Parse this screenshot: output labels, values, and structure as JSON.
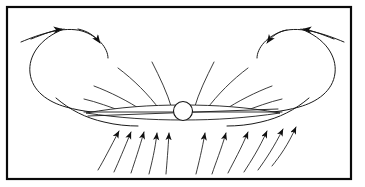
{
  "figure": {
    "background_color": "#ffffff",
    "frame": {
      "name": "outer-border",
      "stroke_color": "#0a0a0a",
      "stroke_width": 2.2,
      "x": 7,
      "y": 7,
      "width": 344,
      "height": 172
    },
    "central_object": {
      "label": "central compact object",
      "shape": "circle",
      "cx": 183,
      "cy": 111,
      "r": 9.5,
      "fill": "#ffffff",
      "stroke": "#141414"
    },
    "disk": {
      "label": "thin accretion disk",
      "shape": "lens",
      "left_x": 86,
      "right_x": 280,
      "center_y": 112,
      "half_thickness": 3.2,
      "stroke": "#1a1a1a"
    },
    "line_color": "#1a1a1a",
    "arrow_color": "#101010",
    "counts": {
      "upper_field_lines": 8,
      "lower_inflow_arrows": 11,
      "loop_arcs": 2,
      "loop_arrowheads": 4
    },
    "annotations": {
      "upper_flow_description": "field lines fanning upward and outward from the disk surface",
      "lower_flow_description": "converging inflow arrows pointing up toward the disk",
      "loop_description": "two large recirculating loops, left and right, with arrowheads at the top"
    }
  }
}
